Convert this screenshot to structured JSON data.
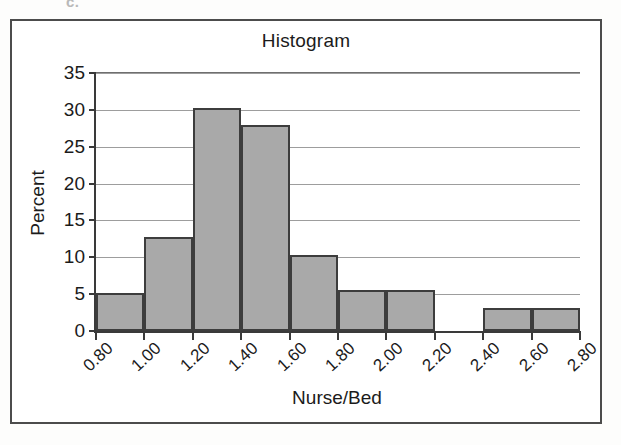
{
  "figure": {
    "label": "c."
  },
  "chart_data": {
    "type": "bar",
    "title": "Histogram",
    "xlabel": "Nurse/Bed",
    "ylabel": "Percent",
    "ylim": [
      0,
      35
    ],
    "xlim": [
      0.8,
      2.8
    ],
    "grid": true,
    "legend": "none",
    "yticks": [
      35,
      30,
      25,
      20,
      15,
      10,
      5,
      0
    ],
    "ytick_labels": [
      "35",
      "30",
      "25",
      "20",
      "15",
      "10",
      "5",
      "0"
    ],
    "xticks": [
      0.8,
      1.0,
      1.2,
      1.4,
      1.6,
      1.8,
      2.0,
      2.2,
      2.4,
      2.6,
      2.8
    ],
    "xtick_labels": [
      "0.80",
      "1.00",
      "1.20",
      "1.40",
      "1.60",
      "1.80",
      "2.00",
      "2.20",
      "2.40",
      "2.60",
      "2.80"
    ],
    "bin_width": 0.2,
    "bins": [
      {
        "from": 0.8,
        "to": 1.0,
        "value": 5.1
      },
      {
        "from": 1.0,
        "to": 1.2,
        "value": 12.7
      },
      {
        "from": 1.2,
        "to": 1.4,
        "value": 30.2
      },
      {
        "from": 1.4,
        "to": 1.6,
        "value": 28.0
      },
      {
        "from": 1.6,
        "to": 1.8,
        "value": 10.3
      },
      {
        "from": 1.8,
        "to": 2.0,
        "value": 5.5
      },
      {
        "from": 2.0,
        "to": 2.2,
        "value": 5.5
      },
      {
        "from": 2.2,
        "to": 2.4,
        "value": 0.0
      },
      {
        "from": 2.4,
        "to": 2.6,
        "value": 3.1
      },
      {
        "from": 2.6,
        "to": 2.8,
        "value": 3.1
      }
    ],
    "categories": [
      "0.80-1.00",
      "1.00-1.20",
      "1.20-1.40",
      "1.40-1.60",
      "1.60-1.80",
      "1.80-2.00",
      "2.00-2.20",
      "2.20-2.40",
      "2.40-2.60",
      "2.60-2.80"
    ],
    "values": [
      5.1,
      12.7,
      30.2,
      28.0,
      10.3,
      5.5,
      5.5,
      0.0,
      3.1,
      3.1
    ],
    "colors": {
      "bar_fill": "#a9a9a9",
      "bar_edge": "#3d3d3d",
      "axis": "#3a3a3a",
      "grid": "#9d9d9d",
      "text": "#1b1b1b",
      "frame": "#4c4c4c",
      "background": "#ffffff"
    }
  }
}
